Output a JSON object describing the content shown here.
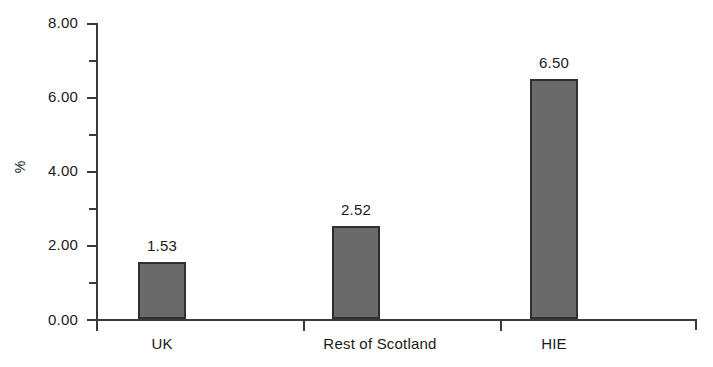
{
  "chart_data": {
    "type": "bar",
    "title": "",
    "subtitle": "",
    "xlabel": "",
    "ylabel": "%",
    "categories": [
      "UK",
      "Rest of Scotland",
      "HIE"
    ],
    "values": [
      1.53,
      2.52,
      6.5
    ],
    "value_labels": [
      "1.53",
      "2.52",
      "6.50"
    ],
    "ylim": [
      0,
      8
    ],
    "ytick_values": [
      0,
      2,
      4,
      6,
      8
    ],
    "ytick_labels": [
      "0.00",
      "2.00",
      "4.00",
      "6.00",
      "8.00"
    ],
    "yminor_tick_values": [
      1,
      3,
      5,
      7
    ],
    "grid": false,
    "legend": null,
    "series": [
      {
        "name": "",
        "values": [
          1.53,
          2.52,
          6.5
        ],
        "color": "#6a6a6a",
        "edge_color": "#2f2f2f"
      }
    ],
    "colors": {
      "bar_fill": "#6a6a6a",
      "bar_edge": "#2f2f2f",
      "axis": "#3a3a3a",
      "text": "#1a1a1a",
      "background": "#ffffff"
    }
  }
}
